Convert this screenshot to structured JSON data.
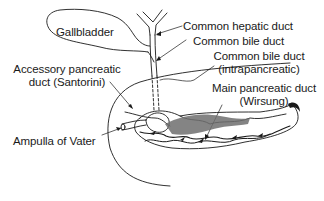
{
  "diagram": {
    "type": "anatomical-illustration",
    "labels": {
      "gallbladder": "Gallbladder",
      "common_hepatic_duct": "Common hepatic duct",
      "common_bile_duct": "Common bile duct",
      "cbd_intra_line1": "Common bile duct",
      "cbd_intra_line2": "(intrapancreatic)",
      "accessory_line1": "Accessory pancreatic",
      "accessory_line2": "duct (Santorini)",
      "main_duct_line1": "Main pancreatic duct",
      "main_duct_line2": "(Wirsung)",
      "ampulla": "Ampulla of Vater"
    },
    "colors": {
      "line": "#1a1a1a",
      "shade": "#6e6e6e",
      "background": "#ffffff"
    }
  }
}
